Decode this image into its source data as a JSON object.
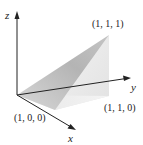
{
  "diagram": {
    "type": "3d-solid",
    "axes": {
      "x": {
        "label": "x"
      },
      "y": {
        "label": "y"
      },
      "z": {
        "label": "z"
      }
    },
    "points": [
      {
        "id": "p111",
        "label": "(1, 1, 1)"
      },
      {
        "id": "p110",
        "label": "(1, 1, 0)"
      },
      {
        "id": "p100",
        "label": "(1, 0, 0)"
      }
    ],
    "colors": {
      "axis": "#222222",
      "face_dark": "#b8b8b8",
      "face_mid": "#d4d4d4",
      "face_light": "#e8e8e8",
      "face_lightest": "#f1f1f1"
    }
  }
}
